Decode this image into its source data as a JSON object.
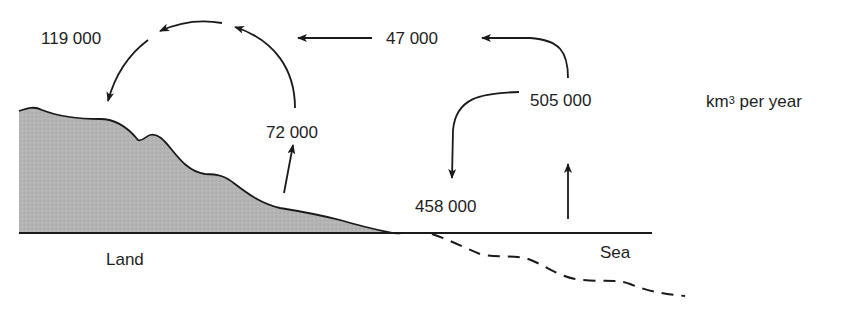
{
  "diagram": {
    "type": "water-cycle-flux",
    "unit": {
      "base": "km",
      "superscript": "3",
      "suffix": " per year"
    },
    "regions": {
      "land": "Land",
      "sea": "Sea"
    },
    "flows": [
      {
        "id": "land-evaporation",
        "label": "72 000",
        "description": "Evaporation from land",
        "direction": "up"
      },
      {
        "id": "land-precipitation",
        "label": "119 000",
        "description": "Precipitation on land",
        "direction": "down"
      },
      {
        "id": "sea-to-land-transport",
        "label": "47 000",
        "description": "Atmospheric transport from sea to land",
        "direction": "left"
      },
      {
        "id": "sea-evaporation",
        "label": "505 000",
        "description": "Evaporation from sea",
        "direction": "up"
      },
      {
        "id": "sea-precipitation",
        "label": "458 000",
        "description": "Precipitation on sea",
        "direction": "down"
      }
    ],
    "colors": {
      "line": "#1a1a1a",
      "land_fill": "#b4b4b4",
      "text": "#1e1e1e",
      "background": "#ffffff"
    }
  }
}
